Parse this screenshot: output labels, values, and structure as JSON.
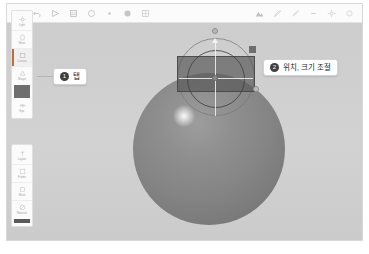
{
  "app": {
    "name": "3d-modeling-canvas"
  },
  "toolbar": {
    "left_items": [
      {
        "name": "back-icon",
        "label": "Back"
      },
      {
        "name": "undo-icon",
        "label": "Undo"
      },
      {
        "name": "redo-icon",
        "label": "Redo"
      },
      {
        "name": "layers-icon",
        "label": "Layers"
      },
      {
        "name": "circle-icon",
        "label": "Shape"
      },
      {
        "name": "dot-icon",
        "label": "Point"
      },
      {
        "name": "sphere-icon",
        "label": "Sphere"
      },
      {
        "name": "grid-icon",
        "label": "Grid"
      }
    ],
    "right_items": [
      {
        "name": "render-icon",
        "label": "Render"
      },
      {
        "name": "brush-icon",
        "label": "Brush"
      },
      {
        "name": "eyedropper-icon",
        "label": "Pick"
      },
      {
        "name": "minus-icon",
        "label": "Zoom Out"
      },
      {
        "name": "settings-icon",
        "label": "Settings"
      },
      {
        "name": "more-icon",
        "label": "More"
      }
    ]
  },
  "sidebar_top": {
    "items": [
      {
        "name": "sidebar-item-light",
        "label": "Light",
        "icon": "sun-icon",
        "active": false
      },
      {
        "name": "sidebar-item-move",
        "label": "Move",
        "icon": "move-icon",
        "active": false
      },
      {
        "name": "sidebar-item-canvas",
        "label": "Canvas",
        "icon": "square-icon",
        "active": true
      },
      {
        "name": "sidebar-item-shape",
        "label": "Shape",
        "icon": "shape-icon",
        "active": false
      },
      {
        "name": "sidebar-item-color-swatch",
        "label": "",
        "icon": "swatch",
        "active": false
      },
      {
        "name": "sidebar-item-eye",
        "label": "Eye",
        "icon": "eye-icon",
        "active": false
      }
    ]
  },
  "sidebar_bottom": {
    "items": [
      {
        "name": "sidebar-item-layout",
        "label": "Layout",
        "icon": "layout-icon",
        "active": false
      },
      {
        "name": "sidebar-item-frame",
        "label": "Frame",
        "icon": "frame-icon",
        "active": false
      },
      {
        "name": "sidebar-item-mask",
        "label": "Mask",
        "icon": "mask-icon",
        "active": false
      },
      {
        "name": "sidebar-item-material",
        "label": "Material",
        "icon": "material-icon",
        "active": false
      },
      {
        "name": "sidebar-item-dark-swatch",
        "label": "",
        "icon": "swatch-dark",
        "active": false
      }
    ]
  },
  "callouts": [
    {
      "number": "1",
      "text": "탭"
    },
    {
      "number": "2",
      "text": "위치, 크기 조절"
    }
  ],
  "colors": {
    "canvas_bg": "#cfcfcf",
    "sphere": "#8a8a8a",
    "selection_fill": "#5a5a5a",
    "accent": "#c86b3a",
    "badge": "#3f3f3f"
  }
}
